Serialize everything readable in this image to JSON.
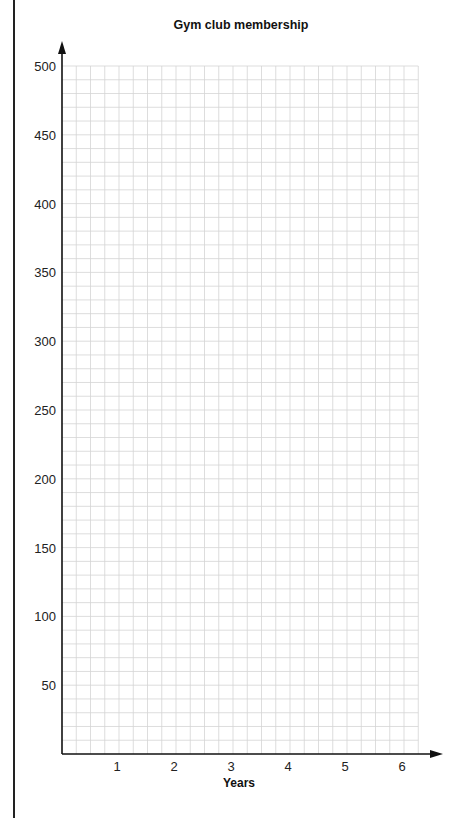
{
  "chart_data": {
    "type": "line",
    "title": "Gym club membership",
    "xlabel": "Years",
    "ylabel": "",
    "x_ticks": [
      1,
      2,
      3,
      4,
      5,
      6
    ],
    "y_ticks": [
      50,
      100,
      150,
      200,
      250,
      300,
      350,
      400,
      450,
      500
    ],
    "xlim": [
      0,
      6.25
    ],
    "ylim": [
      0,
      500
    ],
    "grid": true,
    "grid_minor_x": 0.25,
    "grid_minor_y": 10,
    "series": [],
    "note": "Blank grid with no plotted data"
  },
  "colors": {
    "axis": "#111111",
    "grid": "#d4d4d4",
    "text": "#222222"
  }
}
